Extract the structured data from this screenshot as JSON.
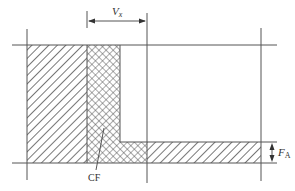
{
  "diagram": {
    "labels": {
      "vx": "V",
      "vx_sub": "x",
      "fa": "F",
      "fa_sub": "A",
      "cf": "CF"
    },
    "colors": {
      "line": "#555555",
      "hatch": "#555555",
      "background": "#ffffff"
    },
    "regions": [
      {
        "name": "left-hatched-block",
        "pattern": "diagonal"
      },
      {
        "name": "cf-crosshatch-column",
        "pattern": "crosshatch"
      },
      {
        "name": "bottom-crosshatch-band",
        "pattern": "crosshatch"
      },
      {
        "name": "bottom-hatched-band",
        "pattern": "diagonal"
      }
    ]
  }
}
